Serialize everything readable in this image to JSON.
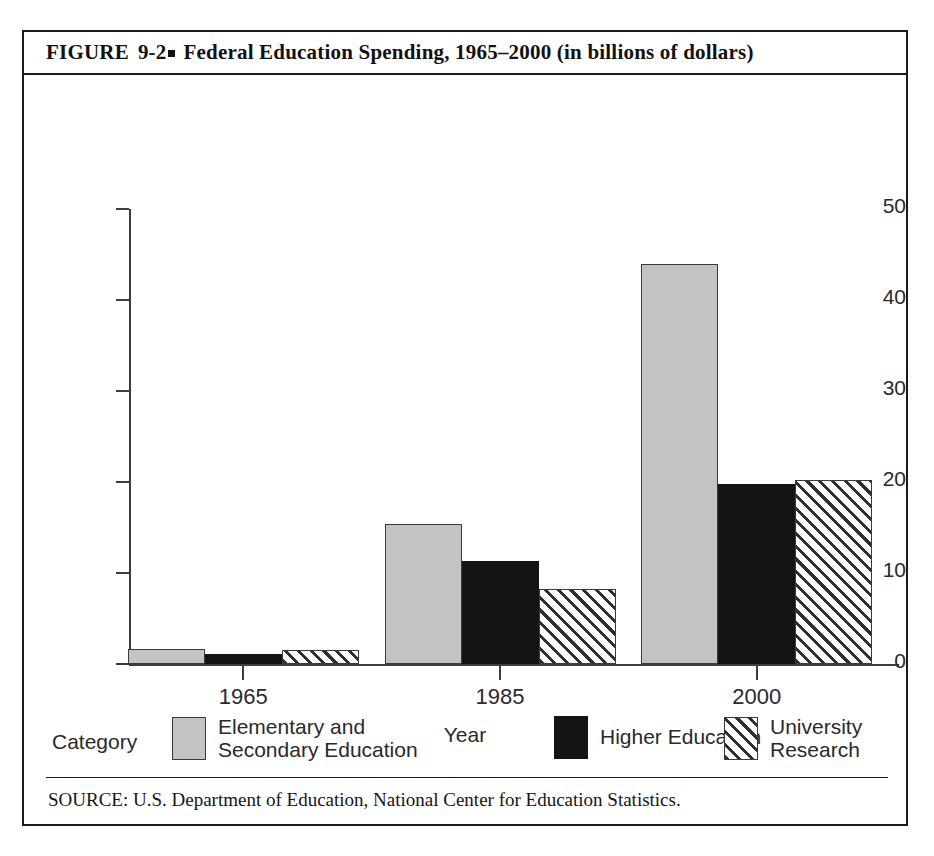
{
  "figure": {
    "label": "FIGURE",
    "number": "9-2",
    "title": "Federal Education Spending, 1965–2000 (in billions of dollars)",
    "source": "SOURCE: U.S. Department of Education, National Center for Education Statistics."
  },
  "legend": {
    "title": "Category"
  },
  "chart_data": {
    "type": "bar",
    "title": "Federal Education Spending, 1965–2000 (in billions of dollars)",
    "xlabel": "Year",
    "ylabel": "",
    "categories": [
      "1965",
      "1985",
      "2000"
    ],
    "ylim": [
      0,
      50
    ],
    "yticks": [
      0,
      10,
      20,
      30,
      40,
      50
    ],
    "ytick_labels": [
      "0",
      "10",
      "20",
      "30",
      "40",
      "50"
    ],
    "grid": false,
    "legend_position": "bottom",
    "series": [
      {
        "name": "Elementary and\nSecondary Education",
        "fill": "solid-gray",
        "color": "#c3c3c3",
        "values": [
          1.6,
          15.4,
          44.0
        ]
      },
      {
        "name": "Higher Education",
        "fill": "solid-black",
        "color": "#141414",
        "values": [
          1.1,
          11.3,
          19.8
        ]
      },
      {
        "name": "University Research",
        "fill": "hatched",
        "color": "#ffffff",
        "values": [
          1.5,
          8.2,
          20.2
        ]
      }
    ]
  }
}
